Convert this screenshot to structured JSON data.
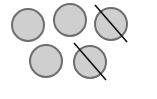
{
  "diagram": {
    "total_circles": 5,
    "crossed_out_count": 2,
    "remaining_count": 3,
    "colors": {
      "fill": "#cfcfcf",
      "stroke": "#6e6e6e",
      "cross_line": "#111111",
      "background": "#ffffff"
    },
    "circles": [
      {
        "cx": 28,
        "cy": 25,
        "r": 16,
        "crossed": false
      },
      {
        "cx": 70,
        "cy": 20,
        "r": 16,
        "crossed": false
      },
      {
        "cx": 111,
        "cy": 24,
        "r": 16,
        "crossed": true,
        "line": {
          "x1": 95,
          "y1": 5,
          "x2": 127,
          "y2": 42
        }
      },
      {
        "cx": 46,
        "cy": 61,
        "r": 16,
        "crossed": false
      },
      {
        "cx": 90,
        "cy": 62,
        "r": 16,
        "crossed": true,
        "line": {
          "x1": 74,
          "y1": 43,
          "x2": 106,
          "y2": 80
        }
      }
    ]
  }
}
